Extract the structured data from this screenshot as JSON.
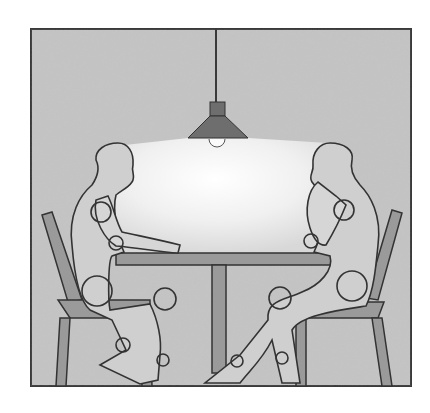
{
  "illustration": {
    "subject": "Two seated figures facing each other across a pedestal table under a pendant lamp",
    "elements": [
      "pendant-lamp",
      "light-cone",
      "table",
      "left-chair",
      "right-chair",
      "left-figure",
      "right-figure"
    ],
    "colors": {
      "background": "#ffffff",
      "wall": "#c4c4c4",
      "frame": "#3a3a3a",
      "light": "#f4f4f4",
      "lamp_shade": "#6e6e6e",
      "furniture": "#9a9a9a",
      "figure_fill": "#cfcfcf",
      "outline": "#333333"
    }
  }
}
